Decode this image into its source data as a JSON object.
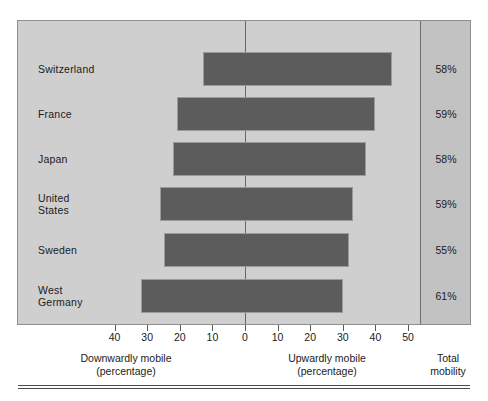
{
  "chart_data": {
    "type": "bar",
    "orientation": "horizontal",
    "style": "diverging-bar",
    "title": "",
    "categories": [
      "Switzerland",
      "France",
      "Japan",
      "United States",
      "Sweden",
      "West Germany"
    ],
    "series": [
      {
        "name": "Downwardly mobile (percentage)",
        "values": [
          13,
          21,
          22,
          26,
          25,
          32
        ]
      },
      {
        "name": "Upwardly mobile (percentage)",
        "values": [
          45,
          40,
          37,
          33,
          32,
          30
        ]
      }
    ],
    "annotations": {
      "name": "Total mobility",
      "values": [
        "58%",
        "59%",
        "58%",
        "59%",
        "55%",
        "61%"
      ]
    },
    "xlabel_left": "Downwardly mobile",
    "xlabel_left_sub": "(percentage)",
    "xlabel_right": "Upwardly mobile",
    "xlabel_right_sub": "(percentage)",
    "ylabel": "",
    "xlim": [
      -48,
      58
    ],
    "ticks": [
      {
        "label": "40",
        "value": -40
      },
      {
        "label": "30",
        "value": -30
      },
      {
        "label": "20",
        "value": -20
      },
      {
        "label": "10",
        "value": -10
      },
      {
        "label": "0",
        "value": 0
      },
      {
        "label": "10",
        "value": 10
      },
      {
        "label": "20",
        "value": 20
      },
      {
        "label": "30",
        "value": 30
      },
      {
        "label": "40",
        "value": 40
      },
      {
        "label": "50",
        "value": 50
      }
    ],
    "grid": false,
    "legend": "none",
    "colors": {
      "bar": "#5c5c5c",
      "panel_background": "#cfcfcf",
      "total_panel_background": "#c2c2c2",
      "text": "#1b1b1b",
      "axis": "#5a5a5a"
    }
  },
  "rows": [
    {
      "label": "Switzerland",
      "label_line1": "Switzerland",
      "label_line2": "",
      "down": 13,
      "up": 45,
      "total": "58%"
    },
    {
      "label": "France",
      "label_line1": "France",
      "label_line2": "",
      "down": 21,
      "up": 40,
      "total": "59%"
    },
    {
      "label": "Japan",
      "label_line1": "Japan",
      "label_line2": "",
      "down": 22,
      "up": 37,
      "total": "58%"
    },
    {
      "label": "United States",
      "label_line1": "United",
      "label_line2": "States",
      "down": 26,
      "up": 33,
      "total": "59%"
    },
    {
      "label": "Sweden",
      "label_line1": "Sweden",
      "label_line2": "",
      "down": 25,
      "up": 32,
      "total": "55%"
    },
    {
      "label": "West Germany",
      "label_line1": "West",
      "label_line2": "Germany",
      "down": 32,
      "up": 30,
      "total": "61%"
    }
  ],
  "captions": {
    "down_line1": "Downwardly mobile",
    "down_line2": "(percentage)",
    "up_line1": "Upwardly mobile",
    "up_line2": "(percentage)",
    "total_line1": "Total",
    "total_line2": "mobility"
  }
}
